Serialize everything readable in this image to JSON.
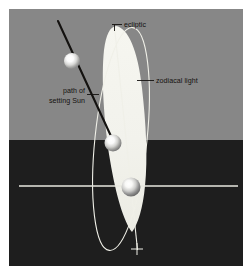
{
  "figure": {
    "canvas": {
      "width": 252,
      "height": 275
    },
    "margin_color": "#ffffff"
  },
  "scene": {
    "sky": {
      "name": "sky",
      "color": "#878787",
      "region": {
        "x": 9,
        "y": 9,
        "width": 234,
        "height": 131
      }
    },
    "ground": {
      "name": "ground",
      "color": "#1e1e1e",
      "region": {
        "x": 9,
        "y": 140,
        "width": 234,
        "height": 126
      }
    },
    "horizon_y": 140,
    "horizontal_axis": {
      "name": "horizontal-reference-line",
      "color": "#e8e8e0",
      "y": 186,
      "x_start": 19,
      "x_end": 238
    }
  },
  "elements": {
    "zodiacal_light": {
      "name": "zodiacal-light-cone",
      "fill": "#f2f2ec",
      "description": "tall tapering luminous cone rising from horizon along the ecliptic"
    },
    "ecliptic_line": {
      "name": "ecliptic-line",
      "color": "#f0f0e8",
      "x1": 114.5,
      "y1": 27,
      "x2": 137.5,
      "y2": 250
    },
    "ellipse_path": {
      "name": "ecliptic-ellipse",
      "color": "#f0f0e8",
      "cx": 121,
      "cy": 139,
      "rx": 26,
      "ry": 112,
      "rotation_deg": 6
    },
    "setting_sun_path": {
      "name": "setting-sun-path-line",
      "color": "#141210",
      "x1": 58,
      "y1": 21,
      "x2": 116,
      "y2": 147
    },
    "cross_mark": {
      "name": "ecliptic-cross-mark",
      "color": "#f0f0e8",
      "x": 137,
      "y": 249
    }
  },
  "suns": [
    {
      "name": "sun-upper",
      "cx": 72,
      "cy": 61,
      "r": 8.0,
      "core": "#ffffff",
      "edge": "#8a8a8a",
      "label": "Sun high in sky"
    },
    {
      "name": "sun-horizon",
      "cx": 113,
      "cy": 143,
      "r": 8.5,
      "core": "#ffffff",
      "edge": "#7c7c7c",
      "label": "Sun at horizon"
    },
    {
      "name": "sun-lower",
      "cx": 131,
      "cy": 187,
      "r": 9.5,
      "core": "#ffffff",
      "edge": "#6e6e6e",
      "label": "Sun below horizon"
    }
  ],
  "labels": {
    "ecliptic": {
      "name": "label-ecliptic",
      "text": "ecliptic",
      "text_x": 124,
      "text_y": 27,
      "anchor": "start",
      "leader": {
        "x1": 112,
        "y1": 24.5,
        "x2": 122,
        "y2": 24.5,
        "drop_x": 114.5,
        "drop_y1": 24.5,
        "drop_y2": 30
      }
    },
    "zodiacal_light": {
      "name": "label-zodiacal-light",
      "text": "zodiacal light",
      "text_x": 156,
      "text_y": 83,
      "anchor": "start",
      "leader": {
        "x1": 137,
        "y1": 80.5,
        "x2": 154,
        "y2": 80.5
      }
    },
    "setting_sun": {
      "name": "label-path-of-setting-sun",
      "line1": "path of",
      "line2": "setting Sun",
      "text_x": 85,
      "text_y": 97,
      "line_height": 10,
      "anchor": "end",
      "leader": {
        "x1": 87,
        "y1": 94.5,
        "x2": 99,
        "y2": 94.5
      }
    }
  }
}
